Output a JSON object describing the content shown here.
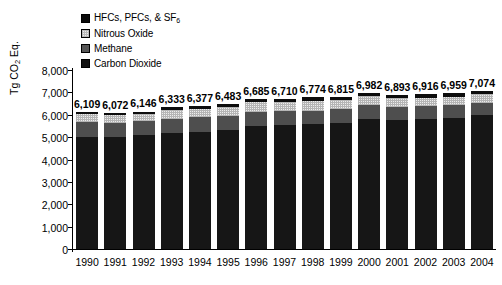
{
  "chart_data": {
    "type": "bar",
    "subtype": "stacked-bar",
    "title": "",
    "xlabel": "",
    "ylabel": "Tg CO2 Eq.",
    "ylabel_parts": {
      "pre": "Tg CO",
      "sub": "2",
      "post": " Eq."
    },
    "ylim": [
      0,
      8000
    ],
    "ytick_labels": [
      "8,000",
      "7,000",
      "6,000",
      "5,000",
      "4,000",
      "3,000",
      "2,000",
      "1,000",
      "0"
    ],
    "ytick_values": [
      8000,
      7000,
      6000,
      5000,
      4000,
      3000,
      2000,
      1000,
      0
    ],
    "grid": false,
    "legend_position": "top-left-inside",
    "categories": [
      "1990",
      "1991",
      "1992",
      "1993",
      "1994",
      "1995",
      "1996",
      "1997",
      "1998",
      "1999",
      "2000",
      "2001",
      "2002",
      "2003",
      "2004"
    ],
    "totals": [
      6109,
      6072,
      6146,
      6333,
      6377,
      6483,
      6685,
      6710,
      6774,
      6815,
      6982,
      6893,
      6916,
      6959,
      7074
    ],
    "total_labels": [
      "6,109",
      "6,072",
      "6,146",
      "6,333",
      "6,377",
      "6,483",
      "6,685",
      "6,710",
      "6,774",
      "6,815",
      "6,982",
      "6,893",
      "6,916",
      "6,959",
      "7,074"
    ],
    "stack_order_bottom_to_top": [
      "Carbon Dioxide",
      "Methane",
      "Nitrous Oxide",
      "HFCs, PFCs, & SF6"
    ],
    "series": [
      {
        "name": "Carbon Dioxide",
        "key": "co2",
        "color": "#161616",
        "values": [
          5002,
          4998,
          5082,
          5180,
          5245,
          5315,
          5505,
          5535,
          5570,
          5640,
          5830,
          5760,
          5800,
          5855,
          5970
        ]
      },
      {
        "name": "Methane",
        "key": "ch4",
        "color": "#4e4e4e",
        "values": [
          660,
          655,
          645,
          640,
          635,
          630,
          625,
          620,
          610,
          600,
          595,
          590,
          580,
          575,
          570
        ]
      },
      {
        "name": "Nitrous Oxide",
        "key": "n2o",
        "color": "#ededed",
        "values": [
          355,
          320,
          320,
          400,
          390,
          400,
          420,
          420,
          440,
          410,
          400,
          395,
          380,
          375,
          375
        ]
      },
      {
        "name": "HFCs, PFCs, & SF6",
        "key": "hfc",
        "color": "#0d0d0d",
        "values": [
          92,
          99,
          99,
          113,
          107,
          138,
          135,
          135,
          154,
          165,
          157,
          148,
          156,
          154,
          159
        ]
      }
    ]
  },
  "legend": {
    "items": [
      {
        "label_pre": "HFCs, PFCs, & SF",
        "label_sub": "6",
        "label_post": "",
        "key": "hfc",
        "name": "hfcs-pfcs-sf6"
      },
      {
        "label_pre": "Nitrous Oxide",
        "label_sub": "",
        "label_post": "",
        "key": "n2o",
        "name": "nitrous-oxide"
      },
      {
        "label_pre": "Methane",
        "label_sub": "",
        "label_post": "",
        "key": "ch4",
        "name": "methane"
      },
      {
        "label_pre": "Carbon Dioxide",
        "label_sub": "",
        "label_post": "",
        "key": "co2",
        "name": "carbon-dioxide"
      }
    ]
  }
}
